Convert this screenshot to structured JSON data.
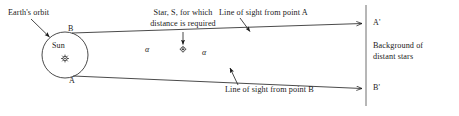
{
  "diagram": {
    "colors": {
      "ink": "#1a1a1a",
      "line": "#2b2b2b",
      "background": "#ffffff"
    },
    "labels": {
      "earths_orbit": "Earth's orbit",
      "sun": "Sun",
      "point_b": "B",
      "point_a": "A",
      "star_note_line1": "Star, S, for which",
      "star_note_line2": "distance is required",
      "line_of_sight_a": "Line of sight from point A",
      "line_of_sight_b": "Line of sight from point B",
      "a_prime": "A'",
      "b_prime": "B'",
      "background_line1": "Background of",
      "background_line2": "distant stars",
      "alpha_left": "α",
      "alpha_right": "α"
    },
    "icons": {
      "sun_glyph": "sun-icon",
      "star_glyph": "star-icon"
    },
    "geometry": {
      "orbit_center_x": 65,
      "orbit_center_y": 55,
      "orbit_radius_x": 23,
      "orbit_radius_y": 23,
      "point_b_x": 72,
      "point_b_y": 33,
      "point_a_x": 73,
      "point_a_y": 76,
      "star_x": 183,
      "star_y": 49,
      "backdrop_x": 366,
      "backdrop_top_y": 5,
      "backdrop_bottom_y": 106,
      "a_prime_x": 366,
      "a_prime_y": 24,
      "b_prime_x": 366,
      "b_prime_y": 89
    }
  }
}
